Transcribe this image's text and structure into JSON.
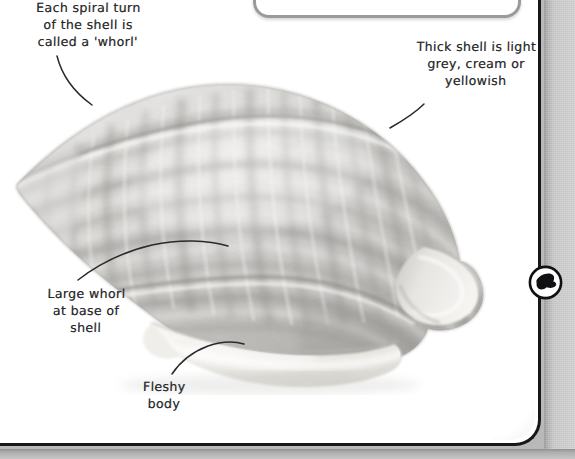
{
  "page": {
    "background_color": "#ffffff",
    "frame_color": "#17171a",
    "gutter_color": "#c9c9c9",
    "ink_color": "#2a2a2c"
  },
  "top_box": {
    "name": "rounded callout box clipped at top edge",
    "border_color": "#9a9a9e",
    "fill_color": "#ffffff",
    "text": ""
  },
  "photo": {
    "subject": "sea snail shell",
    "alt": "Photograph of a whelk-like spiral sea snail shell, light grey and cream with mottled banding, fleshy pale body emerging at the base",
    "shell_color": "#cfcfcf",
    "body_color": "#f2f0ec"
  },
  "callouts": [
    {
      "id": "whorl",
      "text": "Each spiral turn\nof the shell is\ncalled a 'whorl'",
      "points_to": "spire whorls near apex"
    },
    {
      "id": "thickness",
      "text": "Thick shell is light\ngrey, cream or\nyellowish",
      "points_to": "outer body whorl surface"
    },
    {
      "id": "large_whorl",
      "text": "Large whorl\nat base of\nshell",
      "points_to": "largest basal whorl"
    },
    {
      "id": "fleshy_body",
      "text": "Fleshy\nbody",
      "points_to": "soft body at shell aperture"
    }
  ],
  "badge": {
    "name": "shell silhouette badge",
    "icon": "shell-silhouette-icon",
    "ring_color": "#111114",
    "fill_color": "#111114",
    "label": ""
  }
}
